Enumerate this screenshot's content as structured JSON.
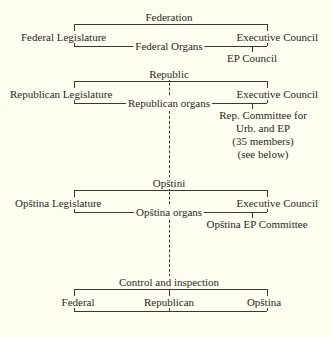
{
  "diagram": {
    "background_color": "#fdfdf0",
    "line_color": "#3a3a30",
    "text_color": "#2a2a22"
  },
  "levels": {
    "federation": {
      "heading": "Federation",
      "left": "Federal Legislature",
      "right": "Executive Council",
      "organs": "Federal Organs",
      "branch": "EP Council"
    },
    "republic": {
      "heading": "Republic",
      "left": "Republican Legislature",
      "right": "Executive Council",
      "organs": "Republican organs",
      "committee_line1": "Rep. Committee for",
      "committee_line2": "Urb. and EP",
      "committee_line3": "(35 members)",
      "committee_line4": "(see below)"
    },
    "opstini": {
      "heading": "Opštini",
      "left": "Opština Legislature",
      "right": "Executive Council",
      "organs": "Opština organs",
      "branch": "Opština EP Committee"
    },
    "control": {
      "heading": "Control and inspection",
      "left": "Federal",
      "center": "Republican",
      "right": "Opština"
    }
  }
}
